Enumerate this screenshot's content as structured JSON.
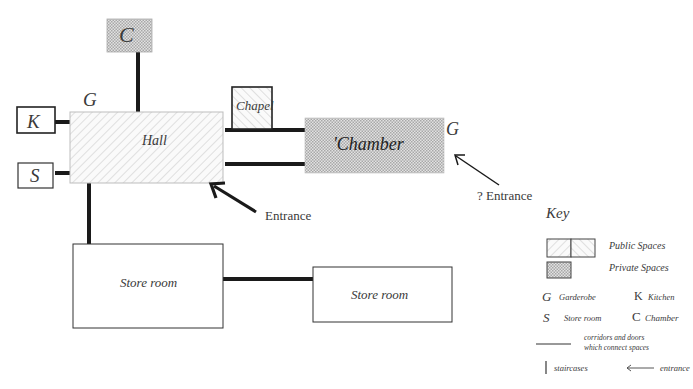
{
  "rooms": {
    "hall": "Hall",
    "chapel": "Chapel",
    "chamber": "'Chamber",
    "chamber_small": "C",
    "kitchen": "K",
    "store_small": "S",
    "store_room_1": "Store room",
    "store_room_2": "Store room"
  },
  "markers": {
    "garderobe_hall": "G",
    "garderobe_chamber": "G"
  },
  "annotations": {
    "entrance": "Entrance",
    "possible_entrance": "? Entrance"
  },
  "key": {
    "title": "Key",
    "public": "Public Spaces",
    "private": "Private Spaces",
    "g_symbol": "G",
    "g_label": "Garderobe",
    "k_symbol": "K",
    "k_label": "Kitchen",
    "s_symbol": "S",
    "s_label": "Store room",
    "c_symbol": "C",
    "c_label": "Chamber",
    "corridor_line1": "corridors and doors",
    "corridor_line2": "which connect spaces",
    "staircases": "staircases",
    "entrance": "entrance"
  },
  "colors": {
    "line": "#1a1a1a",
    "border": "#555555",
    "hatch": "#c8c8c8",
    "crosshatch": "#9a9a9a"
  }
}
